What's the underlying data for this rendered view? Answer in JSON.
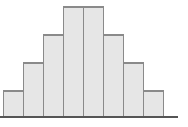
{
  "figure": {
    "colors": {
      "background": "#ffffff",
      "bar_fill": "#e6e6e6",
      "bar_border": "#8a8a8a",
      "baseline": "#555555"
    }
  },
  "chart_data": {
    "type": "bar",
    "categories": [
      "1",
      "2",
      "3",
      "4",
      "5",
      "6",
      "7",
      "8"
    ],
    "values": [
      1,
      2,
      3,
      4,
      4,
      3,
      2,
      1
    ],
    "title": "",
    "xlabel": "",
    "ylabel": "",
    "ylim": [
      0,
      4
    ],
    "grid": false,
    "legend": false,
    "layout_hints": {
      "bars_flush": true,
      "symmetric": true,
      "axis_line_extends_past_bars": true,
      "px_per_unit_height": 28,
      "bar_px_width": 21
    }
  }
}
